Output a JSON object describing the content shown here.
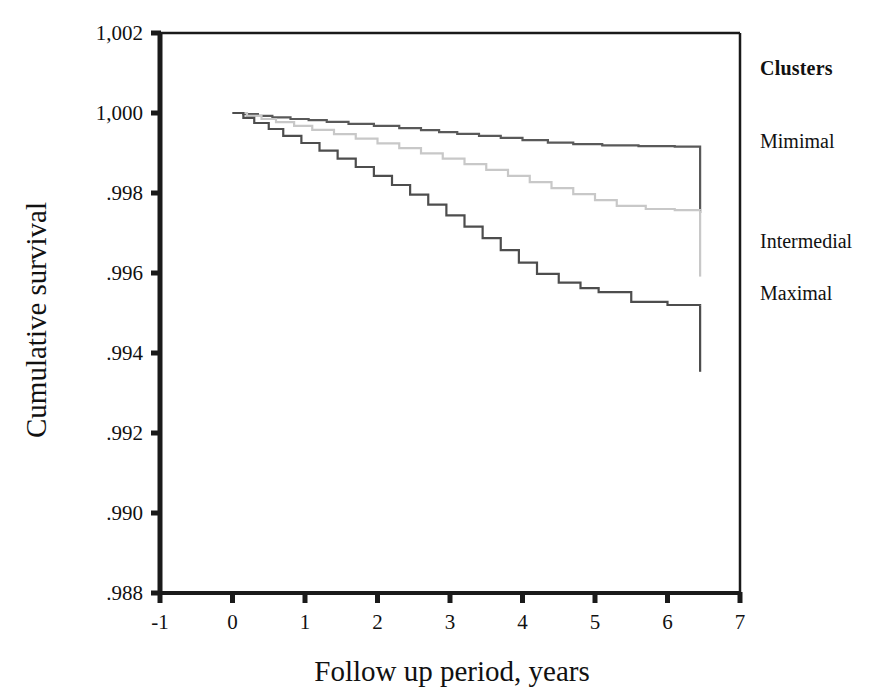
{
  "figure": {
    "background_color": "#ffffff",
    "frame_color": "#1a1a1a"
  },
  "axis": {
    "y_title": "Cumulative survival",
    "x_title": "Follow up period, years",
    "y_tick_labels": [
      "1,002",
      "1,000",
      ".998",
      ".996",
      ".994",
      ".992",
      ".990",
      ".988"
    ],
    "x_tick_labels": [
      "-1",
      "0",
      "1",
      "2",
      "3",
      "4",
      "5",
      "6",
      "7"
    ]
  },
  "legend": {
    "title": "Clusters",
    "items": [
      {
        "label": "Mimimal",
        "color": "#595959"
      },
      {
        "label": "Intermedial",
        "color": "#c8c8c8"
      },
      {
        "label": "Maximal",
        "color": "#4d4d4d"
      }
    ]
  },
  "chart_data": {
    "type": "line",
    "title": "",
    "subtitle": "",
    "xlabel": "Follow up period, years",
    "ylabel": "Cumulative survival",
    "xlim": [
      -1,
      7
    ],
    "ylim": [
      0.988,
      1.002
    ],
    "xticks": [
      -1,
      0,
      1,
      2,
      3,
      4,
      5,
      6,
      7
    ],
    "yticks": [
      1.002,
      1.0,
      0.998,
      0.996,
      0.994,
      0.992,
      0.99,
      0.988
    ],
    "grid": false,
    "legend_position": "right",
    "step_style": "post",
    "series": [
      {
        "name": "Mimimal",
        "color": "#595959",
        "censor_drop_to": 0.99915,
        "x": [
          0.0,
          0.15,
          0.35,
          0.55,
          0.8,
          1.05,
          1.3,
          1.6,
          1.95,
          2.3,
          2.6,
          2.85,
          3.1,
          3.4,
          3.7,
          4.0,
          4.35,
          4.7,
          5.1,
          5.6,
          6.1,
          6.45
        ],
        "y": [
          1.0,
          0.99997,
          0.99993,
          0.99989,
          0.99985,
          0.99982,
          0.99978,
          0.99973,
          0.99968,
          0.99962,
          0.99957,
          0.99952,
          0.99948,
          0.99943,
          0.99938,
          0.99932,
          0.99926,
          0.99922,
          0.99919,
          0.99917,
          0.99916,
          0.99915
        ]
      },
      {
        "name": "Intermedial",
        "color": "#c8c8c8",
        "censor_drop_to": 0.99756,
        "x": [
          0.0,
          0.2,
          0.4,
          0.6,
          0.85,
          1.1,
          1.4,
          1.7,
          2.0,
          2.3,
          2.6,
          2.9,
          3.2,
          3.5,
          3.8,
          4.1,
          4.4,
          4.7,
          5.0,
          5.3,
          5.7,
          6.1,
          6.45
        ],
        "y": [
          1.0,
          0.99993,
          0.99985,
          0.99977,
          0.99968,
          0.99958,
          0.99947,
          0.99936,
          0.99924,
          0.99912,
          0.99899,
          0.99886,
          0.99872,
          0.99858,
          0.99843,
          0.99827,
          0.99812,
          0.99797,
          0.99782,
          0.99768,
          0.9976,
          0.99757,
          0.99756
        ]
      },
      {
        "name": "Maximal",
        "color": "#4d4d4d",
        "censor_drop_to": 0.99518,
        "x": [
          0.0,
          0.15,
          0.3,
          0.5,
          0.7,
          0.95,
          1.2,
          1.45,
          1.7,
          1.95,
          2.2,
          2.45,
          2.7,
          2.95,
          3.2,
          3.45,
          3.7,
          3.95,
          4.2,
          4.5,
          4.8,
          5.05,
          5.5,
          6.0,
          6.45
        ],
        "y": [
          1.0,
          0.99988,
          0.99975,
          0.9996,
          0.99943,
          0.99925,
          0.99906,
          0.99886,
          0.99865,
          0.99843,
          0.9982,
          0.99796,
          0.99771,
          0.99744,
          0.99716,
          0.99687,
          0.99657,
          0.99626,
          0.99598,
          0.99576,
          0.99562,
          0.99552,
          0.99528,
          0.9952,
          0.99518
        ]
      }
    ]
  }
}
